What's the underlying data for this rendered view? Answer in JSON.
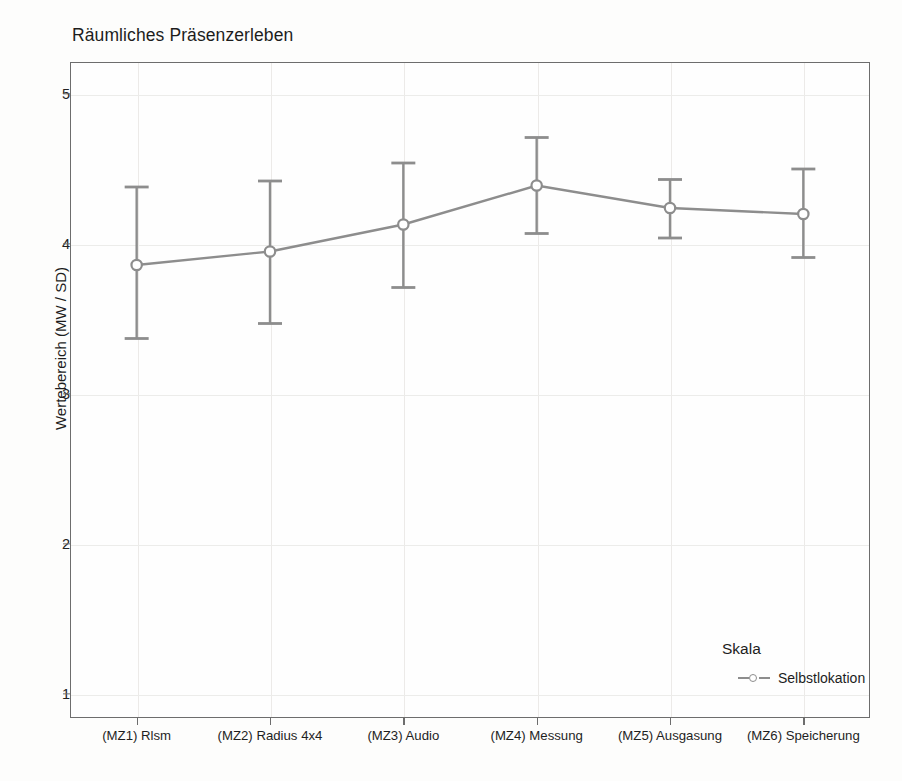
{
  "chart_data": {
    "type": "line",
    "title": "Räumliches Präsenzerleben",
    "xlabel": "",
    "ylabel": "Wertebereich (MW / SD)",
    "ylim": [
      1,
      5
    ],
    "yticks": [
      1,
      2,
      3,
      4,
      5
    ],
    "grid": true,
    "legend_position": "inside-bottom-right",
    "legend_title": "Skala",
    "categories": [
      "(MZ1) Rlsm",
      "(MZ2) Radius 4x4",
      "(MZ3) Audio",
      "(MZ4) Messung",
      "(MZ5) Ausgasung",
      "(MZ6) Speicherung"
    ],
    "series": [
      {
        "name": "Selbstlokation",
        "values": [
          3.86,
          3.95,
          4.13,
          4.39,
          4.24,
          4.2
        ],
        "error_upper": [
          4.38,
          4.42,
          4.54,
          4.71,
          4.43,
          4.5
        ],
        "error_lower": [
          3.37,
          3.47,
          3.71,
          4.07,
          4.04,
          3.91
        ],
        "color": "#8d8d8d",
        "marker": "open-circle"
      }
    ]
  },
  "axes": {
    "y_tick_labels": [
      "5",
      "4",
      "3",
      "2",
      "1"
    ]
  },
  "legend": {
    "title": "Skala",
    "entries": [
      {
        "label": "Selbstlokation"
      }
    ]
  },
  "colors": {
    "series": "#8d8d8d",
    "frame": "#6d6d6d",
    "grid": "#ececea",
    "text": "#1d1d1d",
    "background": "#fdfdfc"
  }
}
